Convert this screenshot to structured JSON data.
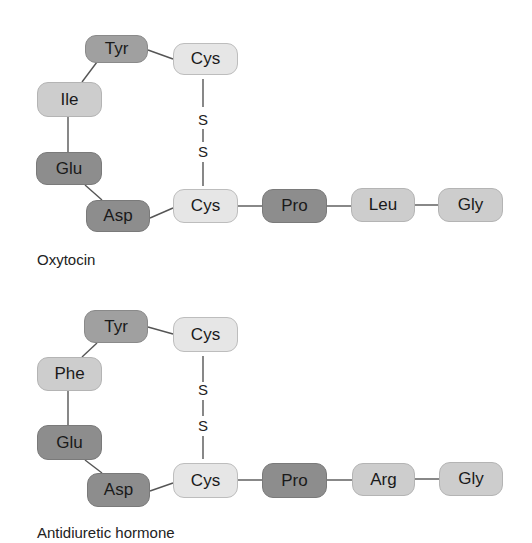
{
  "diagrams": [
    {
      "name": "Oxytocin",
      "caption": "Oxytocin",
      "residues": {
        "tyr": "Tyr",
        "ile": "Ile",
        "glu": "Glu",
        "asp": "Asp",
        "cys_top": "Cys",
        "cys_bottom": "Cys",
        "pro": "Pro",
        "pos8": "Leu",
        "gly": "Gly"
      },
      "disulfide": [
        "S",
        "S"
      ]
    },
    {
      "name": "Antidiuretic hormone",
      "caption": "Antidiuretic hormone",
      "residues": {
        "tyr": "Tyr",
        "ile": "Phe",
        "glu": "Glu",
        "asp": "Asp",
        "cys_top": "Cys",
        "cys_bottom": "Cys",
        "pro": "Pro",
        "pos8": "Arg",
        "gly": "Gly"
      },
      "disulfide": [
        "S",
        "S"
      ]
    }
  ],
  "colors": {
    "dark": "#8d8d8d",
    "medium": "#a0a0a0",
    "light": "#cdcdcd",
    "pale": "#e6e6e6",
    "link": "#555555",
    "background": "#ffffff"
  }
}
